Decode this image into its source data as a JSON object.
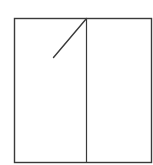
{
  "diagram": {
    "type": "line-drawing",
    "stroke_color": "#3a3a3a",
    "background_color": "#ffffff",
    "outer_frame": {
      "x1": 14.5,
      "y1": 18.5,
      "x2": 151.5,
      "y2": 162.5
    },
    "divider": {
      "x": 86.5,
      "y1": 18.5,
      "y2": 162.5
    },
    "diagonal": {
      "x1": 86.5,
      "y1": 18.5,
      "x2": 53.5,
      "y2": 57.5
    },
    "panels": [
      {
        "id": "left-panel",
        "x": 14.5,
        "y": 18.5,
        "width": 72,
        "height": 144
      },
      {
        "id": "right-panel",
        "x": 86.5,
        "y": 18.5,
        "width": 65,
        "height": 144
      }
    ]
  }
}
